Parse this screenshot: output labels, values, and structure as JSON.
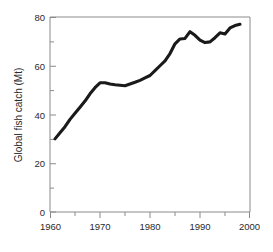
{
  "chart_data": {
    "type": "line",
    "title": "",
    "xlabel": "",
    "ylabel": "Global fish catch (Mt)",
    "xlim": [
      1960,
      2000
    ],
    "ylim": [
      0,
      80
    ],
    "grid": false,
    "legend": "none",
    "x_ticks_major": [
      1960,
      1970,
      1980,
      1990,
      2000
    ],
    "x_ticks_minor": [
      1965,
      1975,
      1985,
      1995
    ],
    "y_ticks_major": [
      0,
      20,
      40,
      60,
      80
    ],
    "y_ticks_minor": [
      10,
      30,
      50,
      70
    ],
    "x_tick_labels": [
      "1960",
      "1970",
      "1980",
      "1990",
      "2000"
    ],
    "y_tick_labels": [
      "0",
      "20",
      "40",
      "60",
      "80"
    ],
    "series": [
      {
        "name": "Global fish catch",
        "color": "#1a1a1a",
        "x": [
          1961,
          1962,
          1963,
          1964,
          1965,
          1966,
          1967,
          1968,
          1969,
          1970,
          1971,
          1972,
          1973,
          1974,
          1975,
          1976,
          1977,
          1978,
          1979,
          1980,
          1981,
          1982,
          1983,
          1984,
          1985,
          1986,
          1987,
          1988,
          1989,
          1990,
          1991,
          1992,
          1993,
          1994,
          1995,
          1996,
          1997,
          1998
        ],
        "values": [
          30.0,
          32.5,
          35.0,
          38.0,
          40.5,
          43.0,
          45.5,
          48.5,
          51.0,
          53.0,
          53.0,
          52.5,
          52.2,
          52.0,
          51.8,
          52.5,
          53.2,
          54.0,
          55.0,
          56.0,
          58.0,
          60.0,
          62.0,
          65.0,
          69.0,
          71.0,
          71.2,
          74.0,
          72.5,
          70.5,
          69.5,
          69.8,
          71.5,
          73.5,
          73.0,
          75.5,
          76.5,
          77.0
        ]
      }
    ]
  },
  "axis": {
    "y_title": "Global fish catch (Mt)"
  }
}
